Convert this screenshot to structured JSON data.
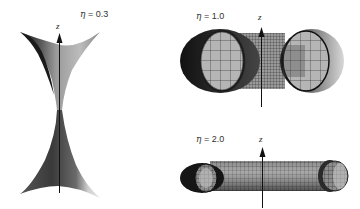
{
  "figure": {
    "panels": [
      {
        "id": "eta-0.3",
        "eta_symbol": "η",
        "eta_text": " = 0.3",
        "axis_label": "z",
        "shape": "hyperboloid-like (narrow waist, flared ends)"
      },
      {
        "id": "eta-1.0",
        "eta_symbol": "η",
        "eta_text": " = 1.0",
        "axis_label": "z",
        "shape": "twin spheres joined by short tube"
      },
      {
        "id": "eta-2.0",
        "eta_symbol": "η",
        "eta_text": " = 2.0",
        "axis_label": "z",
        "shape": "long tube with open rounded ends"
      }
    ],
    "colors": {
      "dark": "#1a1a1a",
      "mid": "#707070",
      "light": "#bdbdbd",
      "lighter": "#d8d8d8",
      "mesh": "#222222"
    }
  }
}
